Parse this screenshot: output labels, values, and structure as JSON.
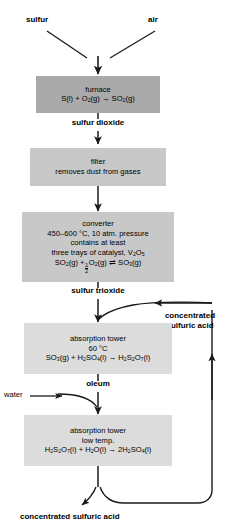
{
  "diagram": {
    "type": "process-flowchart",
    "colors": {
      "box_dark": "#aaaaaa",
      "box_mid": "#c8c8c8",
      "box_light": "#dcdcdc",
      "stroke": "#1a1a1a",
      "background": "#ffffff"
    },
    "inputs": {
      "sulfur": "sulfur",
      "air": "air",
      "water": "water"
    },
    "nodes": [
      {
        "id": "furnace",
        "name": "furnace",
        "shade": "dark",
        "lines": [
          {
            "kind": "text",
            "text": "furnace"
          },
          {
            "kind": "equation",
            "text": "S(l) + O2(g) → SO2(g)"
          }
        ]
      },
      {
        "id": "filter",
        "name": "filter",
        "shade": "mid",
        "lines": [
          {
            "kind": "text",
            "text": "filter"
          },
          {
            "kind": "text",
            "text": "removes dust from gases"
          }
        ]
      },
      {
        "id": "converter",
        "name": "converter",
        "shade": "mid",
        "lines": [
          {
            "kind": "text",
            "text": "converter"
          },
          {
            "kind": "text",
            "text": "450–600 °C, 10 atm. pressure"
          },
          {
            "kind": "text",
            "text": "contains at least"
          },
          {
            "kind": "text",
            "text": "three trays of catalyst, V2O5"
          },
          {
            "kind": "equation",
            "text": "SO2(g) + ½O2(g) ⇌ SO3(g)"
          }
        ]
      },
      {
        "id": "absorption-tower-1",
        "name": "absorption tower",
        "shade": "light",
        "lines": [
          {
            "kind": "text",
            "text": "absorption tower"
          },
          {
            "kind": "text",
            "text": "60 °C"
          },
          {
            "kind": "equation",
            "text": "SO3(g) + H2SO4(l) → H2S2O7(l)"
          }
        ]
      },
      {
        "id": "absorption-tower-2",
        "name": "absorption tower",
        "shade": "light",
        "lines": [
          {
            "kind": "text",
            "text": "absorption tower"
          },
          {
            "kind": "text",
            "text": "low temp."
          },
          {
            "kind": "equation",
            "text": "H2S2O7(l) + H2O(l) → 2H2SO4(l)"
          }
        ]
      }
    ],
    "furnace": {
      "title": "furnace",
      "eq_a": "S(l) + O",
      "eq_b": "(g) → SO",
      "eq_c": "(g)",
      "sub1": "2",
      "sub2": "2"
    },
    "filter": {
      "title": "filter",
      "subtitle": "removes dust from gases"
    },
    "converter": {
      "title": "converter",
      "conditions": "450–600 °C, 10 atm. pressure",
      "contains": "contains at least",
      "catalyst_a": "three trays of catalyst, V",
      "catalyst_sub1": "2",
      "catalyst_b": "O",
      "catalyst_sub2": "5",
      "eq_a": "SO",
      "eq_sub1": "2",
      "eq_b": "(g) +",
      "frac_num": "1",
      "frac_den": "2",
      "eq_c": "O",
      "eq_sub2": "2",
      "eq_d": "(g)",
      "eq_arrow": "⇌",
      "eq_e": "SO",
      "eq_sub3": "3",
      "eq_f": "(g)"
    },
    "tower1": {
      "title": "absorption tower",
      "temp": "60 °C",
      "eq_a": "SO",
      "eq_sub1": "3",
      "eq_b": "(g) + H",
      "eq_sub2": "2",
      "eq_c": "SO",
      "eq_sub3": "4",
      "eq_d": "(l) → H",
      "eq_sub4": "2",
      "eq_e": "S",
      "eq_sub5": "2",
      "eq_f": "O",
      "eq_sub6": "7",
      "eq_g": "(l)"
    },
    "tower2": {
      "title": "absorption tower",
      "temp": "low temp.",
      "eq_a": "H",
      "eq_sub1": "2",
      "eq_b": "S",
      "eq_sub2": "2",
      "eq_c": "O",
      "eq_sub3": "7",
      "eq_d": "(l) + H",
      "eq_sub4": "2",
      "eq_e": "O(l) → 2H",
      "eq_sub5": "2",
      "eq_f": "SO",
      "eq_sub6": "4",
      "eq_g": "(l)"
    },
    "stream_labels": {
      "sulfur_dioxide": "sulfur dioxide",
      "sulfur_trioxide": "sulfur trioxide",
      "oleum": "oleum",
      "recycle_line1": "concentrated",
      "recycle_line2": "sulfuric acid",
      "product": "concentrated sulfuric acid"
    }
  }
}
